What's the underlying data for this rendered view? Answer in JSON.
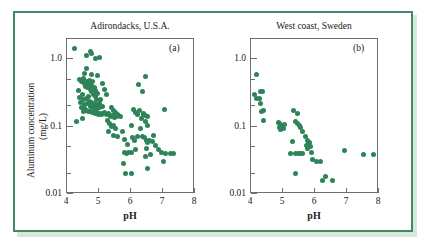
{
  "figure": {
    "frame_color": "#3f8a63",
    "marker_color": "#2e8458",
    "axis_color": "#6e6e6e"
  },
  "labels": {
    "y_axis_line1": "Aluminum concentration",
    "y_axis_line2": "(mg/L)",
    "x_axis": "pH",
    "panel_a_tag": "(a)",
    "panel_b_tag": "(b)",
    "y_tick_top": "1.0",
    "y_tick_mid": "0.1",
    "y_tick_bottom": "0.01",
    "x_tick_4": "4",
    "x_tick_5": "5",
    "x_tick_6": "6",
    "x_tick_7": "7",
    "x_tick_8": "8"
  },
  "chart_data": [
    {
      "type": "scatter",
      "id": "panel-a",
      "title": "Adirondacks, U.S.A.",
      "tag": "(a)",
      "xlabel": "pH",
      "ylabel": "Aluminum concentration (mg/L)",
      "xlim": [
        4,
        8
      ],
      "ylim": [
        0.01,
        2.0
      ],
      "yscale": "log",
      "xscale": "linear",
      "xticks": [
        4,
        5,
        6,
        7,
        8
      ],
      "yticks": [
        0.01,
        0.1,
        1.0
      ],
      "ytick_labels": [
        "0.01",
        "0.1",
        "1.0"
      ],
      "grid": false,
      "legend": "none",
      "marker": "filled-circle",
      "marker_color": "#2e8458",
      "n_points": 118,
      "points": [
        [
          4.22,
          1.45
        ],
        [
          4.62,
          1.15
        ],
        [
          4.72,
          1.3
        ],
        [
          4.78,
          1.22
        ],
        [
          4.88,
          1.02
        ],
        [
          5.02,
          1.05
        ],
        [
          4.62,
          0.72
        ],
        [
          4.4,
          0.5
        ],
        [
          4.45,
          0.47
        ],
        [
          4.5,
          0.52
        ],
        [
          4.55,
          0.44
        ],
        [
          4.58,
          0.4
        ],
        [
          4.6,
          0.46
        ],
        [
          4.65,
          0.38
        ],
        [
          4.68,
          0.43
        ],
        [
          4.7,
          0.49
        ],
        [
          4.72,
          0.36
        ],
        [
          4.75,
          0.41
        ],
        [
          4.78,
          0.33
        ],
        [
          4.8,
          0.46
        ],
        [
          4.82,
          0.3
        ],
        [
          4.85,
          0.38
        ],
        [
          4.88,
          0.28
        ],
        [
          4.9,
          0.34
        ],
        [
          4.92,
          0.25
        ],
        [
          4.95,
          0.31
        ],
        [
          4.35,
          0.34
        ],
        [
          4.38,
          0.27
        ],
        [
          4.42,
          0.23
        ],
        [
          4.48,
          0.3
        ],
        [
          4.52,
          0.25
        ],
        [
          4.56,
          0.21
        ],
        [
          4.6,
          0.26
        ],
        [
          4.64,
          0.22
        ],
        [
          4.66,
          0.28
        ],
        [
          4.7,
          0.24
        ],
        [
          4.73,
          0.2
        ],
        [
          4.76,
          0.23
        ],
        [
          4.8,
          0.21
        ],
        [
          4.83,
          0.19
        ],
        [
          4.86,
          0.22
        ],
        [
          4.9,
          0.2
        ],
        [
          4.93,
          0.18
        ],
        [
          4.96,
          0.21
        ],
        [
          5.0,
          0.19
        ],
        [
          5.03,
          0.22
        ],
        [
          5.06,
          0.25
        ],
        [
          5.1,
          0.2
        ],
        [
          4.45,
          0.19
        ],
        [
          4.5,
          0.17
        ],
        [
          4.55,
          0.185
        ],
        [
          4.62,
          0.175
        ],
        [
          4.68,
          0.165
        ],
        [
          4.74,
          0.17
        ],
        [
          4.79,
          0.16
        ],
        [
          4.84,
          0.165
        ],
        [
          4.88,
          0.155
        ],
        [
          4.92,
          0.16
        ],
        [
          4.97,
          0.15
        ],
        [
          5.02,
          0.155
        ],
        [
          5.07,
          0.15
        ],
        [
          5.12,
          0.155
        ],
        [
          5.18,
          0.16
        ],
        [
          5.24,
          0.15
        ],
        [
          5.3,
          0.155
        ],
        [
          5.1,
          0.43
        ],
        [
          5.18,
          0.36
        ],
        [
          5.22,
          0.3
        ],
        [
          4.95,
          0.57
        ],
        [
          4.78,
          0.6
        ],
        [
          4.55,
          0.62
        ],
        [
          4.3,
          0.12
        ],
        [
          4.48,
          0.13
        ],
        [
          5.35,
          0.14
        ],
        [
          5.42,
          0.145
        ],
        [
          5.48,
          0.135
        ],
        [
          5.55,
          0.14
        ],
        [
          5.62,
          0.145
        ],
        [
          5.68,
          0.14
        ],
        [
          5.4,
          0.19
        ],
        [
          5.46,
          0.175
        ],
        [
          5.52,
          0.16
        ],
        [
          5.58,
          0.15
        ],
        [
          5.33,
          0.11
        ],
        [
          5.4,
          0.1
        ],
        [
          5.52,
          0.095
        ],
        [
          5.46,
          0.105
        ],
        [
          5.28,
          0.125
        ],
        [
          5.3,
          0.085
        ],
        [
          5.44,
          0.075
        ],
        [
          5.58,
          0.072
        ],
        [
          5.72,
          0.085
        ],
        [
          5.8,
          0.065
        ],
        [
          5.88,
          0.055
        ],
        [
          5.92,
          0.041
        ],
        [
          5.86,
          0.04
        ],
        [
          5.8,
          0.042
        ],
        [
          5.78,
          0.028
        ],
        [
          5.82,
          0.02
        ],
        [
          6.02,
          0.02
        ],
        [
          6.0,
          0.042
        ],
        [
          6.05,
          0.068
        ],
        [
          6.1,
          0.062
        ],
        [
          6.0,
          0.105
        ],
        [
          6.08,
          0.18
        ],
        [
          6.14,
          0.16
        ],
        [
          6.2,
          0.15
        ],
        [
          6.26,
          0.175
        ],
        [
          6.32,
          0.13
        ],
        [
          6.38,
          0.15
        ],
        [
          6.35,
          0.33
        ],
        [
          6.45,
          0.56
        ],
        [
          6.22,
          0.42
        ],
        [
          6.4,
          0.155
        ],
        [
          6.46,
          0.145
        ],
        [
          6.52,
          0.14
        ],
        [
          6.44,
          0.12
        ],
        [
          6.52,
          0.105
        ],
        [
          6.3,
          0.095
        ],
        [
          6.36,
          0.072
        ],
        [
          6.42,
          0.068
        ],
        [
          6.48,
          0.063
        ],
        [
          6.52,
          0.058
        ],
        [
          6.58,
          0.062
        ],
        [
          6.48,
          0.048
        ],
        [
          6.44,
          0.036
        ],
        [
          6.5,
          0.024
        ],
        [
          6.62,
          0.039
        ],
        [
          6.66,
          0.06
        ],
        [
          6.7,
          0.075
        ],
        [
          6.78,
          0.052
        ],
        [
          6.86,
          0.045
        ],
        [
          6.94,
          0.042
        ],
        [
          7.0,
          0.03
        ],
        [
          7.08,
          0.04
        ],
        [
          7.04,
          0.18
        ],
        [
          7.22,
          0.04
        ],
        [
          7.32,
          0.04
        ],
        [
          6.2,
          0.072
        ],
        [
          6.14,
          0.045
        ]
      ]
    },
    {
      "type": "scatter",
      "id": "panel-b",
      "title": "West coast, Sweden",
      "tag": "(b)",
      "xlabel": "pH",
      "ylabel": "Aluminum concentration (mg/L)",
      "xlim": [
        4,
        8
      ],
      "ylim": [
        0.01,
        2.0
      ],
      "yscale": "log",
      "xscale": "linear",
      "xticks": [
        4,
        5,
        6,
        7,
        8
      ],
      "yticks": [
        0.01,
        0.1,
        1.0
      ],
      "ytick_labels": [
        "0.01",
        "0.1",
        "1.0"
      ],
      "grid": false,
      "legend": "none",
      "marker": "filled-circle",
      "marker_color": "#2e8458",
      "n_points": 48,
      "points": [
        [
          4.18,
          0.6
        ],
        [
          4.12,
          0.3
        ],
        [
          4.16,
          0.26
        ],
        [
          4.3,
          0.33
        ],
        [
          4.36,
          0.33
        ],
        [
          4.28,
          0.26
        ],
        [
          4.3,
          0.22
        ],
        [
          4.32,
          0.17
        ],
        [
          4.38,
          0.175
        ],
        [
          4.4,
          0.125
        ],
        [
          4.86,
          0.115
        ],
        [
          4.9,
          0.112
        ],
        [
          4.94,
          0.105
        ],
        [
          4.88,
          0.098
        ],
        [
          4.92,
          0.092
        ],
        [
          4.96,
          0.1
        ],
        [
          5.02,
          0.095
        ],
        [
          5.06,
          0.108
        ],
        [
          5.32,
          0.175
        ],
        [
          5.44,
          0.155
        ],
        [
          5.38,
          0.118
        ],
        [
          5.46,
          0.112
        ],
        [
          5.52,
          0.105
        ],
        [
          5.56,
          0.098
        ],
        [
          5.62,
          0.085
        ],
        [
          5.7,
          0.072
        ],
        [
          5.76,
          0.062
        ],
        [
          5.8,
          0.056
        ],
        [
          5.84,
          0.058
        ],
        [
          5.86,
          0.05
        ],
        [
          5.78,
          0.048
        ],
        [
          5.72,
          0.052
        ],
        [
          5.88,
          0.042
        ],
        [
          5.3,
          0.06
        ],
        [
          5.22,
          0.04
        ],
        [
          5.4,
          0.04
        ],
        [
          5.48,
          0.04
        ],
        [
          5.56,
          0.04
        ],
        [
          5.62,
          0.04
        ],
        [
          5.92,
          0.032
        ],
        [
          6.04,
          0.03
        ],
        [
          6.16,
          0.03
        ],
        [
          5.38,
          0.02
        ],
        [
          6.22,
          0.016
        ],
        [
          6.34,
          0.018
        ],
        [
          6.56,
          0.016
        ],
        [
          6.92,
          0.044
        ],
        [
          7.52,
          0.038
        ],
        [
          7.82,
          0.038
        ]
      ]
    }
  ]
}
